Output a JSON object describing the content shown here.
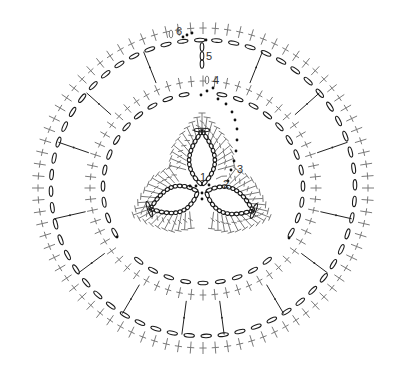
{
  "diagram": {
    "type": "crochet-chart",
    "center": [
      203,
      188
    ],
    "colors": {
      "chain": "#1a1a1a",
      "stitch": "#7a7a7a",
      "dot": "#111111",
      "spoke": "#222222",
      "background": "#ffffff"
    },
    "row_labels": [
      {
        "text": "1",
        "x": 200,
        "y": 181
      },
      {
        "text": "2",
        "x": 223,
        "y": 188
      },
      {
        "text": "3",
        "x": 237,
        "y": 173
      },
      {
        "text": "4",
        "x": 213,
        "y": 84
      },
      {
        "text": "5",
        "x": 206,
        "y": 60
      },
      {
        "text": "6",
        "x": 176,
        "y": 35
      }
    ],
    "rings": {
      "outer_chain": {
        "rx": 152,
        "ry": 148,
        "ovals": 56
      },
      "outer_stitches": {
        "rx": 165,
        "ry": 160,
        "count": 84
      },
      "middle_chain": {
        "rx": 100,
        "ry": 95,
        "ovals": 36,
        "gaps_deg": [
          -90,
          141,
          39
        ]
      },
      "middle_stitches": {
        "rx": 113,
        "ry": 107,
        "count": 60
      }
    },
    "spokes_count": 14,
    "trefoil": {
      "center": [
        202,
        190
      ],
      "petals": [
        {
          "name": "top",
          "angle_deg": -90,
          "length": 60
        },
        {
          "name": "lower-left",
          "angle_deg": 160,
          "length": 56
        },
        {
          "name": "lower-right",
          "angle_deg": 22,
          "length": 56
        }
      ]
    }
  }
}
